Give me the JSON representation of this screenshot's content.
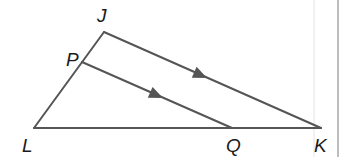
{
  "diagram": {
    "type": "geometry-triangle",
    "vertices": {
      "J": "J",
      "P": "P",
      "L": "L",
      "Q": "Q",
      "K": "K"
    },
    "segments": [
      "JL",
      "LK",
      "JK",
      "PQ"
    ],
    "parallel_marks": [
      {
        "segment": "JK",
        "mark": "single-arrow"
      },
      {
        "segment": "PQ",
        "mark": "single-arrow"
      }
    ],
    "relations": [
      "PQ ∥ JK",
      "P on JL",
      "Q on LK"
    ]
  },
  "colors": {
    "line": "#555555",
    "label": "#1a1a1a",
    "background": "#ffffff"
  }
}
